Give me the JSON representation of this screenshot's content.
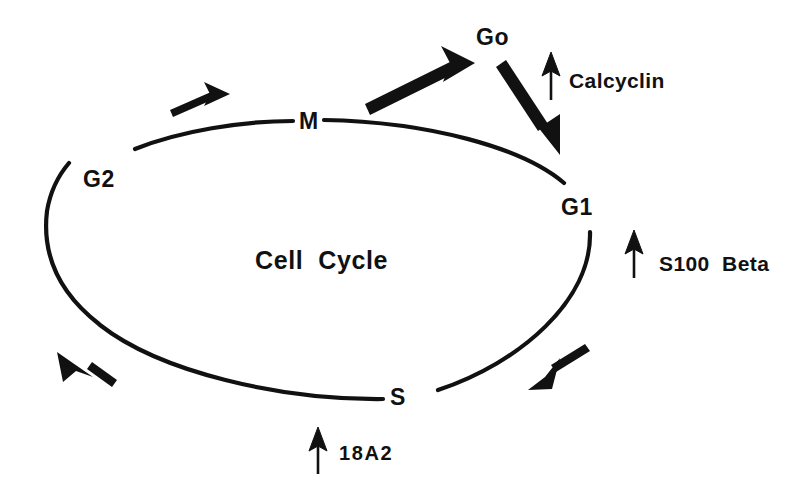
{
  "figure": {
    "title": "Cell Cycle",
    "background_color": "#ffffff",
    "stroke_color": "#111111"
  },
  "center_label": {
    "text": "Cell  Cycle"
  },
  "phases": [
    {
      "id": "m",
      "label": "M",
      "x": 299,
      "y": 110
    },
    {
      "id": "g2",
      "label": "G2",
      "x": 83,
      "y": 168
    },
    {
      "id": "g1",
      "label": "G1",
      "x": 561,
      "y": 196
    },
    {
      "id": "s",
      "label": "S",
      "x": 390,
      "y": 386
    },
    {
      "id": "go",
      "label": "Go",
      "x": 476,
      "y": 26
    }
  ],
  "regulators": [
    {
      "id": "calcyclin",
      "label": "Calcyclin",
      "x": 569,
      "y": 70,
      "arrow": "up-arrow-icon"
    },
    {
      "id": "s100beta",
      "label": "S100  Beta",
      "x": 659,
      "y": 253,
      "arrow": "up-arrow-icon"
    },
    {
      "id": "18a2",
      "label": "18A2",
      "x": 339,
      "y": 443,
      "arrow": "up-arrow-icon"
    }
  ],
  "cycle_arrows": [
    {
      "id": "g2-to-m",
      "direction": "clockwise"
    },
    {
      "id": "g1-to-s",
      "direction": "clockwise"
    },
    {
      "id": "s-to-g2",
      "direction": "clockwise"
    }
  ],
  "quiescence_arrows": [
    {
      "id": "m-to-go",
      "from": "M",
      "to": "Go"
    },
    {
      "id": "go-to-g1",
      "from": "Go",
      "to": "G1"
    }
  ]
}
